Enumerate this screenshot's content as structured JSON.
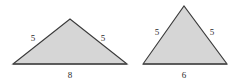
{
  "figure": {
    "background_color": "#ffffff",
    "fill_color": "#d6d6d6",
    "stroke_color": "#3a3a3a",
    "base_stroke_color": "#4a4a4a",
    "label_color": "#2b2b2b",
    "shapes": [
      {
        "name": "triangle-left",
        "type": "triangle",
        "points": [
          [
            13,
            64
          ],
          [
            70,
            19
          ],
          [
            127,
            64
          ]
        ],
        "labels": {
          "left_side": "5",
          "right_side": "5",
          "base": "8"
        },
        "label_positions": {
          "left_side": [
            33,
            34
          ],
          "right_side": [
            103,
            34
          ],
          "base": [
            70,
            71
          ]
        }
      },
      {
        "name": "triangle-right",
        "type": "triangle",
        "points": [
          [
            143,
            64
          ],
          [
            184,
            6
          ],
          [
            227,
            64
          ]
        ],
        "labels": {
          "left_side": "5",
          "right_side": "5",
          "base": "6"
        },
        "label_positions": {
          "left_side": [
            157,
            28
          ],
          "right_side": [
            212,
            28
          ],
          "base": [
            184,
            71
          ]
        }
      }
    ]
  }
}
